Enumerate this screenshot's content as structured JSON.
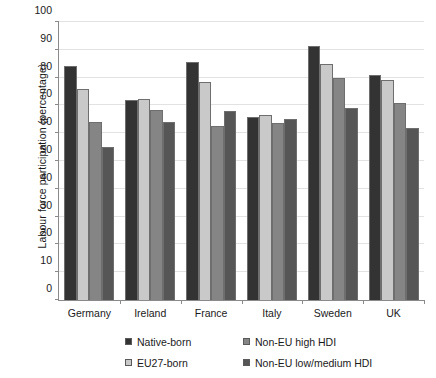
{
  "chart_data": {
    "type": "bar",
    "title": "",
    "xlabel": "",
    "ylabel": "Labour force participation (percentage)",
    "ylim": [
      0,
      100
    ],
    "ytick_step": 10,
    "yticks": [
      0,
      10,
      20,
      30,
      40,
      50,
      60,
      70,
      80,
      90,
      100
    ],
    "grid": true,
    "legend_position": "bottom",
    "categories": [
      "Germany",
      "Ireland",
      "France",
      "Italy",
      "Sweden",
      "UK"
    ],
    "series": [
      {
        "name": "Native-born",
        "color": "#333333",
        "values": [
          84.0,
          72.0,
          85.5,
          66.0,
          91.5,
          81.0
        ]
      },
      {
        "name": "EU27-born",
        "color": "#c9c9c9",
        "values": [
          76.0,
          72.3,
          78.5,
          66.5,
          85.0,
          79.0
        ]
      },
      {
        "name": "Non-EU high HDI",
        "color": "#858585",
        "values": [
          64.0,
          68.3,
          62.5,
          63.5,
          80.0,
          71.0
        ]
      },
      {
        "name": "Non-EU low/medium HDI",
        "color": "#565656",
        "values": [
          55.0,
          64.2,
          68.0,
          65.0,
          69.0,
          62.0
        ]
      }
    ]
  },
  "axis": {
    "y_title": "Labour force participation (percentage)"
  }
}
